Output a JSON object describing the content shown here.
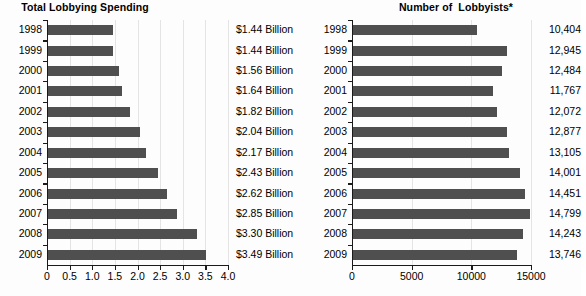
{
  "chart_data": [
    {
      "type": "bar",
      "orientation": "horizontal",
      "title": "Total Lobbying Spending",
      "xlabel": "",
      "ylabel": "",
      "categories": [
        "1998",
        "1999",
        "2000",
        "2001",
        "2002",
        "2003",
        "2004",
        "2005",
        "2006",
        "2007",
        "2008",
        "2009"
      ],
      "values": [
        1.44,
        1.44,
        1.56,
        1.64,
        1.82,
        2.04,
        2.17,
        2.43,
        2.62,
        2.85,
        3.3,
        3.49
      ],
      "value_labels": [
        "$1.44 Billion",
        "$1.44 Billion",
        "$1.56 Billion",
        "$1.64 Billion",
        "$1.82 Billion",
        "$2.04 Billion",
        "$2.17 Billion",
        "$2.43 Billion",
        "$2.62 Billion",
        "$2.85 Billion",
        "$3.30 Billion",
        "$3.49 Billion"
      ],
      "xlim": [
        0,
        4.0
      ],
      "xticks": [
        0,
        0.5,
        1.0,
        1.5,
        2.0,
        2.5,
        3.0,
        3.5,
        4.0
      ],
      "xticklabels": [
        "0",
        "0.5",
        "1.0",
        "1.5",
        "2.0",
        "2.5",
        "3.0",
        "3.5",
        "4.0"
      ],
      "grid": true,
      "legend": "none",
      "bar_color": "#4f4f4f"
    },
    {
      "type": "bar",
      "orientation": "horizontal",
      "title": "Number of  Lobbyists*",
      "xlabel": "",
      "ylabel": "",
      "categories": [
        "1998",
        "1999",
        "2000",
        "2001",
        "2002",
        "2003",
        "2004",
        "2005",
        "2006",
        "2007",
        "2008",
        "2009"
      ],
      "values": [
        10404,
        12945,
        12484,
        11767,
        12072,
        12877,
        13105,
        14001,
        14451,
        14799,
        14243,
        13746
      ],
      "value_labels": [
        "10,404",
        "12,945",
        "12,484",
        "11,767",
        "12,072",
        "12,877",
        "13,105",
        "14,001",
        "14,451",
        "14,799",
        "14,243",
        "13,746"
      ],
      "xlim": [
        0,
        15000
      ],
      "xticks": [
        0,
        5000,
        10000,
        15000
      ],
      "xticklabels": [
        "0",
        "5000",
        "10000",
        "15000"
      ],
      "grid": true,
      "legend": "none",
      "bar_color": "#4f4f4f"
    }
  ],
  "colors": {
    "bar": "#4f4f4f",
    "axis": "#1a1a1a",
    "grid": "#e4e4e4",
    "background": "#fdfdfd",
    "text": "#000000"
  }
}
